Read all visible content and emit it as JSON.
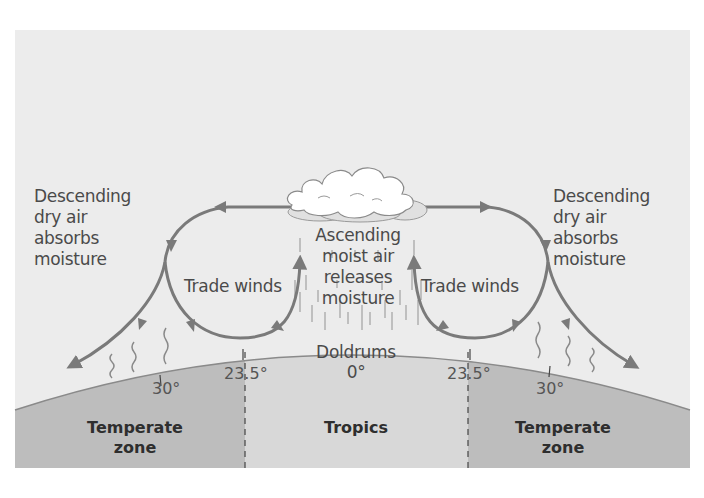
{
  "diagram": {
    "colors": {
      "panel_bg": "#ececec",
      "temperate_zone": "#bdbdbd",
      "tropics_zone": "#d8d8d8",
      "arrow": "#7a7a7a",
      "text": "#4a4a4a",
      "cloud": "#ffffff"
    },
    "labels": {
      "left_descending": [
        "Descending",
        "dry air",
        "absorbs",
        "moisture"
      ],
      "right_descending": [
        "Descending",
        "dry air",
        "absorbs",
        "moisture"
      ],
      "ascending": [
        "Ascending",
        "moist air",
        "releases",
        "moisture"
      ],
      "left_trade_winds": "Trade winds",
      "right_trade_winds": "Trade winds",
      "doldrums": "Doldrums",
      "equator_degree": "0°"
    },
    "latitudes": {
      "left_30": "30°",
      "left_23_5": "23.5°",
      "right_23_5": "23.5°",
      "right_30": "30°"
    },
    "zones": {
      "left_temperate": [
        "Temperate",
        "zone"
      ],
      "tropics": "Tropics",
      "right_temperate": [
        "Temperate",
        "zone"
      ]
    },
    "icons": {
      "cloud": "cloud-icon",
      "rain": "rain-streaks",
      "evaporation": "wavy-moisture-lines",
      "arrow": "airflow-arrow"
    }
  }
}
